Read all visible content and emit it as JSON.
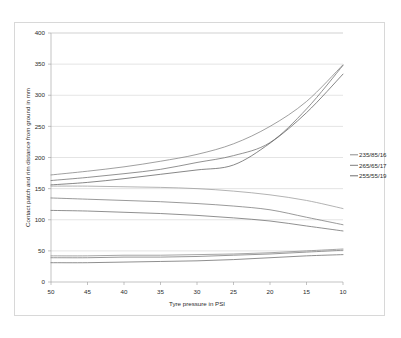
{
  "chart_data": {
    "type": "line",
    "title": "",
    "xlabel": "Tyre pressure in PSI",
    "ylabel": "Contact patch and rim distance from ground in mm",
    "x": [
      50,
      45,
      40,
      35,
      30,
      25,
      20,
      15,
      10
    ],
    "x_tick_labels": [
      "50",
      "45",
      "40",
      "35",
      "30",
      "25",
      "20",
      "15",
      "10"
    ],
    "x_reversed": true,
    "xlim": [
      50,
      10
    ],
    "ylim": [
      0,
      400
    ],
    "y_tick_labels": [
      "0",
      "50",
      "100",
      "150",
      "200",
      "250",
      "300",
      "350",
      "400"
    ],
    "y_ticks": [
      0,
      50,
      100,
      150,
      200,
      250,
      300,
      350,
      400
    ],
    "grid": "horizontal",
    "legend_position": "right",
    "legend_entries": [
      "235/85/16",
      "265/65/17",
      "255/55/19"
    ],
    "series": [
      {
        "name": "235/85/16 rim distance",
        "group": "235/85/16",
        "measure": "rim-distance",
        "color": "#808080",
        "values": [
          172,
          178,
          185,
          194,
          205,
          222,
          250,
          290,
          349
        ]
      },
      {
        "name": "265/65/17 rim distance",
        "group": "265/65/17",
        "measure": "rim-distance",
        "color": "#6e6e6e",
        "values": [
          163,
          168,
          174,
          181,
          192,
          203,
          224,
          278,
          348
        ]
      },
      {
        "name": "255/55/19 rim distance",
        "group": "255/55/19",
        "measure": "rim-distance",
        "color": "#5f5f5f",
        "values": [
          156,
          160,
          166,
          173,
          180,
          188,
          223,
          272,
          334
        ]
      },
      {
        "name": "235/85/16 contact patch",
        "group": "235/85/16",
        "measure": "contact-patch",
        "color": "#9a9a9a",
        "values": [
          154,
          154,
          153,
          152,
          150,
          146,
          140,
          131,
          118
        ]
      },
      {
        "name": "265/65/17 contact patch",
        "group": "265/65/17",
        "measure": "contact-patch",
        "color": "#787878",
        "values": [
          135,
          133,
          131,
          129,
          126,
          122,
          116,
          104,
          92
        ]
      },
      {
        "name": "255/55/19 contact patch",
        "group": "255/55/19",
        "measure": "contact-patch",
        "color": "#6b6b6b",
        "values": [
          115,
          114,
          112,
          110,
          107,
          103,
          98,
          90,
          82
        ]
      },
      {
        "name": "235/85/16 sidewall deflection",
        "group": "235/85/16",
        "measure": "sidewall-deflection",
        "color": "#8a8a8a",
        "values": [
          42,
          42,
          43,
          43,
          44,
          45,
          47,
          50,
          53
        ]
      },
      {
        "name": "265/65/17 sidewall deflection",
        "group": "265/65/17",
        "measure": "sidewall-deflection",
        "color": "#777777",
        "values": [
          39,
          39,
          40,
          40,
          41,
          43,
          45,
          48,
          51
        ]
      },
      {
        "name": "255/55/19 sidewall deflection",
        "group": "255/55/19",
        "measure": "sidewall-deflection",
        "color": "#6a6a6a",
        "values": [
          31,
          31,
          32,
          33,
          34,
          36,
          39,
          42,
          44
        ]
      }
    ]
  }
}
